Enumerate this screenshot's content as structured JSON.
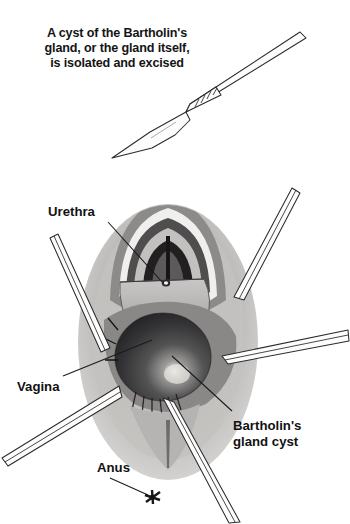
{
  "figure": {
    "kind": "medical-illustration",
    "background_color": "#ffffff",
    "ink_color": "#141414"
  },
  "caption": {
    "lines": [
      "A cyst of the Bartholin's",
      "gland, or the gland itself,",
      "is isolated and excised"
    ]
  },
  "instrument": {
    "name": "scalpel",
    "grip_ridges": 5
  },
  "anatomy": {
    "labels": [
      {
        "id": "urethra",
        "text": "Urethra"
      },
      {
        "id": "vagina",
        "text": "Vagina"
      },
      {
        "id": "bartholins_cyst_line1",
        "text": "Bartholin's"
      },
      {
        "id": "bartholins_cyst_line2",
        "text": "gland cyst"
      },
      {
        "id": "anus",
        "text": "Anus"
      }
    ],
    "cyst": {
      "fill_dark": "#2e2e30",
      "fill_mid": "#4a4a4d",
      "highlight": "#e8e8e6"
    },
    "tissue": {
      "light": "#d6d4d2",
      "mid": "#b0aeac",
      "dark": "#6f6d6c",
      "darkest": "#2a2928"
    },
    "retractor_count": 5
  }
}
